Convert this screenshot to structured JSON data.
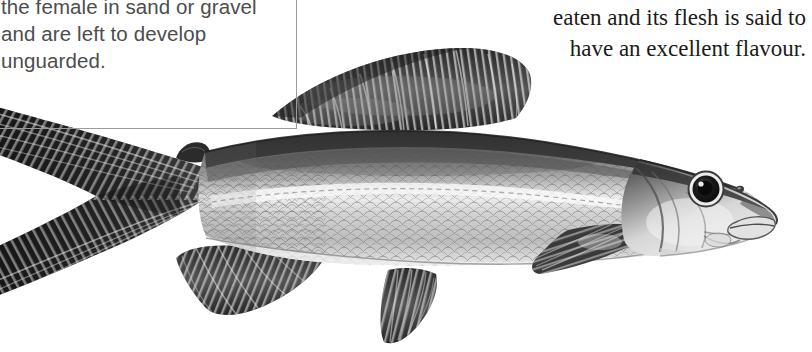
{
  "page": {
    "background_color": "#ffffff",
    "width": 812,
    "height": 352
  },
  "caption_box": {
    "border_color": "#9a9a9a",
    "text_color": "#4d4d4d",
    "text": "shallow depression dug by\nthe female in sand or gravel\nand are left to develop\nunguarded.",
    "lines": [
      "shallow depression dug by",
      "the female in sand or gravel",
      "and are left to develop",
      "unguarded."
    ]
  },
  "body_text": {
    "text_color": "#1b1b1b",
    "alignment": "right",
    "text": "eaten and its flesh is said to\nhave an excellent flavour.",
    "lines": [
      "eaten and its flesh is said to",
      "have an excellent flavour."
    ]
  },
  "illustration": {
    "subject": "fish",
    "style": "grayscale engraving",
    "orientation": "head-right",
    "colors": {
      "dark": "#2e2e2e",
      "mid": "#7c7c7c",
      "light": "#d9d9d9",
      "highlight": "#f2f2f2",
      "fin_dark": "#1f1f1f",
      "outline": "#3a3a3a"
    },
    "parts": [
      {
        "name": "caudal-fin",
        "label": "Tail fin (forked)"
      },
      {
        "name": "anal-fin",
        "label": "Anal fin"
      },
      {
        "name": "adipose-fin",
        "label": "Adipose fin"
      },
      {
        "name": "dorsal-fin",
        "label": "Dorsal fin"
      },
      {
        "name": "pelvic-fin",
        "label": "Pelvic fin"
      },
      {
        "name": "pectoral-fin",
        "label": "Pectoral fin"
      },
      {
        "name": "body",
        "label": "Scaled body"
      },
      {
        "name": "head",
        "label": "Head"
      },
      {
        "name": "gill-cover",
        "label": "Gill cover"
      },
      {
        "name": "eye",
        "label": "Eye"
      },
      {
        "name": "nostril",
        "label": "Nostril"
      },
      {
        "name": "mouth",
        "label": "Mouth"
      },
      {
        "name": "lateral-line",
        "label": "Lateral line"
      }
    ]
  }
}
